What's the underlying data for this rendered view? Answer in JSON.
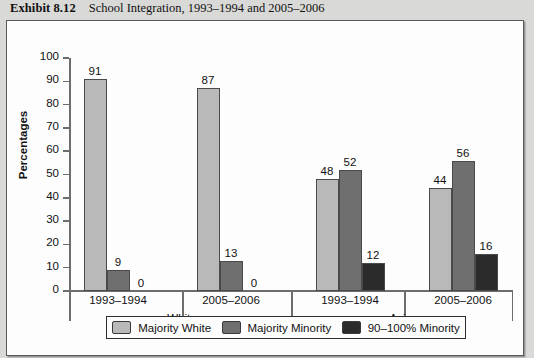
{
  "exhibit": {
    "number": "Exhibit 8.12",
    "title": "School Integration, 1993–1994 and 2005–2006"
  },
  "chart_data": {
    "type": "bar",
    "title": "School Integration, 1993–1994 and 2005–2006",
    "xlabel": "",
    "ylabel": "Percentages",
    "ylim": [
      0,
      100
    ],
    "ytick_step": 10,
    "yticks": [
      0,
      10,
      20,
      30,
      40,
      50,
      60,
      70,
      80,
      90,
      100
    ],
    "grid": false,
    "legend_position": "bottom",
    "categories": [
      "1993–1994",
      "2005–2006",
      "1993–1994",
      "2005–2006"
    ],
    "groups": [
      {
        "name": "White",
        "periods": [
          "1993–1994",
          "2005–2006"
        ]
      },
      {
        "name": "Asian",
        "periods": [
          "1993–1994",
          "2005–2006"
        ]
      }
    ],
    "series": [
      {
        "name": "Majority White",
        "color": "#b9b9b9",
        "values": [
          91,
          87,
          48,
          44
        ]
      },
      {
        "name": "Majority Minority",
        "color": "#6f6f6f",
        "values": [
          9,
          13,
          52,
          56
        ]
      },
      {
        "name": "90–100% Minority",
        "color": "#2b2b2b",
        "values": [
          0,
          0,
          12,
          16
        ]
      }
    ]
  }
}
